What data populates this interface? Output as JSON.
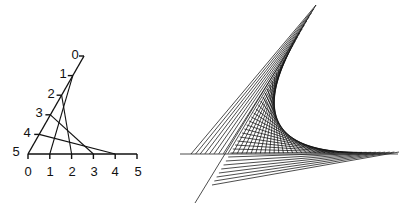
{
  "left_diagram": {
    "description": "Line envelope construction with two labeled axes",
    "horizontal_axis": {
      "labels": [
        "0",
        "1",
        "2",
        "3",
        "4",
        "5"
      ],
      "origin": [
        28,
        154
      ],
      "end": [
        137,
        154
      ]
    },
    "slanted_axis": {
      "labels": [
        "0",
        "1",
        "2",
        "3",
        "4",
        "5"
      ],
      "top": [
        84,
        56
      ],
      "bottom": [
        28,
        154
      ]
    },
    "connections": [
      {
        "from": "1",
        "to": "1"
      },
      {
        "from": "2",
        "to": "2"
      },
      {
        "from": "3",
        "to": "3"
      },
      {
        "from": "4",
        "to": "4"
      }
    ]
  },
  "right_diagram": {
    "description": "String-art envelope forming a parabolic curve",
    "line_a": {
      "start": [
        316,
        5
      ],
      "end": [
        195,
        203
      ],
      "string_start": [
        316,
        5
      ],
      "string_end": [
        212,
        185
      ]
    },
    "line_b": {
      "start": [
        180,
        154
      ],
      "end": [
        398,
        154
      ],
      "string_start": [
        191,
        154
      ],
      "string_end": [
        399,
        152
      ]
    },
    "string_count": 46
  }
}
